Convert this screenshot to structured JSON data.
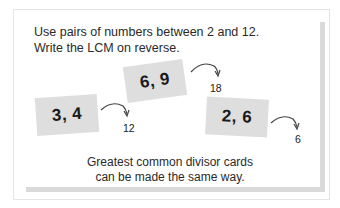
{
  "instructions": {
    "line1": "Use pairs of numbers  between 2 and 12.",
    "line2": "Write the LCM on reverse."
  },
  "cards": [
    {
      "label": "6,  9",
      "result": "18"
    },
    {
      "label": "3,  4",
      "result": "12"
    },
    {
      "label": "2,  6",
      "result": "6"
    }
  ],
  "caption": {
    "line1": "Greatest common divisor cards",
    "line2": "can be made the same way."
  },
  "icons": {
    "arrow": "curved-arrow-icon"
  },
  "colors": {
    "card": "#dedede",
    "shadow": "#d9d9d9",
    "text": "#222222"
  }
}
